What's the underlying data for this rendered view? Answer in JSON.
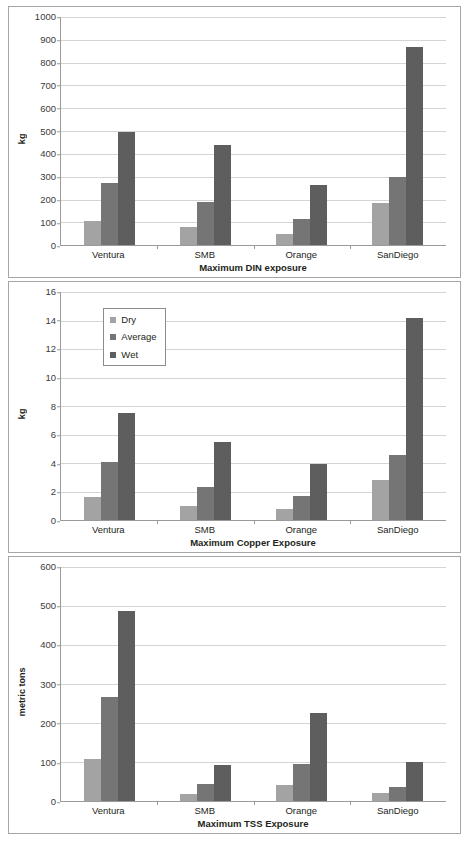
{
  "legend": {
    "position": "top-left-inside-panel-2",
    "entries": [
      {
        "label": "Dry",
        "color": "#a3a3a3"
      },
      {
        "label": "Average",
        "color": "#757575"
      },
      {
        "label": "Wet",
        "color": "#5e5e5e"
      }
    ]
  },
  "chart_data": [
    {
      "type": "bar",
      "title": "",
      "xlabel": "Maximum DIN exposure",
      "ylabel": "kg",
      "categories": [
        "Ventura",
        "SMB",
        "Orange",
        "SanDiego"
      ],
      "series": [
        {
          "name": "Dry",
          "color": "#a3a3a3",
          "values": [
            108,
            80,
            51,
            183
          ]
        },
        {
          "name": "Average",
          "color": "#757575",
          "values": [
            271,
            189,
            115,
            298
          ]
        },
        {
          "name": "Wet",
          "color": "#5e5e5e",
          "values": [
            498,
            437,
            262,
            868
          ]
        }
      ],
      "ylim": [
        0,
        1000
      ],
      "yticks": [
        0,
        100,
        200,
        300,
        400,
        500,
        600,
        700,
        800,
        900,
        1000
      ],
      "grid": true,
      "legend": false
    },
    {
      "type": "bar",
      "title": "",
      "xlabel": "Maximum Copper Exposure",
      "ylabel": "kg",
      "categories": [
        "Ventura",
        "SMB",
        "Orange",
        "SanDiego"
      ],
      "series": [
        {
          "name": "Dry",
          "color": "#a3a3a3",
          "values": [
            1.6,
            1.0,
            0.75,
            2.8
          ]
        },
        {
          "name": "Average",
          "color": "#757575",
          "values": [
            4.1,
            2.35,
            1.7,
            4.6
          ]
        },
        {
          "name": "Wet",
          "color": "#5e5e5e",
          "values": [
            7.5,
            5.45,
            3.95,
            14.2
          ]
        }
      ],
      "ylim": [
        0,
        16
      ],
      "yticks": [
        0,
        2,
        4,
        6,
        8,
        10,
        12,
        14,
        16
      ],
      "grid": true,
      "legend": true
    },
    {
      "type": "bar",
      "title": "",
      "xlabel": "Maximum TSS Exposure",
      "ylabel": "metric tons",
      "categories": [
        "Ventura",
        "SMB",
        "Orange",
        "SanDiego"
      ],
      "series": [
        {
          "name": "Dry",
          "color": "#a3a3a3",
          "values": [
            107,
            18,
            41,
            22
          ]
        },
        {
          "name": "Average",
          "color": "#757575",
          "values": [
            267,
            44,
            94,
            37
          ]
        },
        {
          "name": "Wet",
          "color": "#5e5e5e",
          "values": [
            487,
            93,
            225,
            100
          ]
        }
      ],
      "ylim": [
        0,
        600
      ],
      "yticks": [
        0,
        100,
        200,
        300,
        400,
        500,
        600
      ],
      "grid": true,
      "legend": false
    }
  ]
}
